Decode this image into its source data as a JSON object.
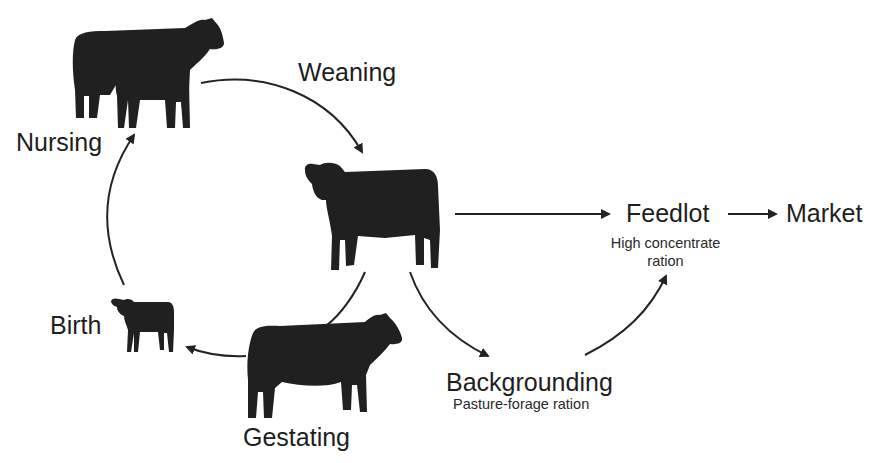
{
  "diagram": {
    "type": "cattle-production-cycle",
    "colors": {
      "ink": "#1e1e1e",
      "cow": "#202020",
      "background": "#ffffff"
    },
    "stages": {
      "nursing": {
        "label": "Nursing",
        "icon": "cow-with-calf-icon"
      },
      "weaning": {
        "label": "Weaning"
      },
      "weaned_calf": {
        "icon": "weaned-calf-icon"
      },
      "feedlot": {
        "label": "Feedlot",
        "sublabel_line1": "High concentrate",
        "sublabel_line2": "ration"
      },
      "market": {
        "label": "Market"
      },
      "backgrounding": {
        "label": "Backgrounding",
        "sublabel": "Pasture-forage ration"
      },
      "gestating": {
        "label": "Gestating",
        "icon": "pregnant-cow-icon"
      },
      "birth": {
        "label": "Birth",
        "icon": "newborn-calf-icon"
      }
    },
    "flows": [
      {
        "from": "Nursing",
        "to": "Weaned calf",
        "via": "Weaning"
      },
      {
        "from": "Weaned calf",
        "to": "Feedlot"
      },
      {
        "from": "Feedlot",
        "to": "Market"
      },
      {
        "from": "Weaned calf",
        "to": "Backgrounding"
      },
      {
        "from": "Backgrounding",
        "to": "Feedlot"
      },
      {
        "from": "Weaned calf",
        "to": "Gestating"
      },
      {
        "from": "Gestating",
        "to": "Birth"
      },
      {
        "from": "Birth",
        "to": "Nursing"
      }
    ]
  }
}
